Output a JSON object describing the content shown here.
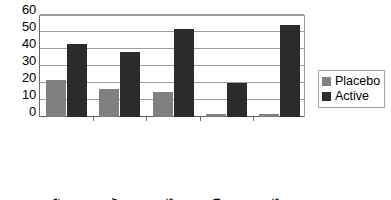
{
  "chart_data": {
    "type": "bar",
    "title": "",
    "subtitle": "",
    "xlabel": "",
    "ylabel": "",
    "categories": [
      "Overall Appearance",
      "Laxity",
      "Fine Lines",
      "Mottled Pigmentation",
      "Wrinkles"
    ],
    "category_lines": [
      [
        "Overall",
        "Appearance"
      ],
      [
        "Laxity"
      ],
      [
        "Fine Lines"
      ],
      [
        "Mottled",
        "Pigmentation"
      ],
      [
        "Wrinkles"
      ]
    ],
    "series": [
      {
        "name": "Placebo",
        "color": "#808080",
        "values": [
          22,
          16.5,
          14.5,
          2,
          2
        ]
      },
      {
        "name": "Active",
        "color": "#2b2b2b",
        "values": [
          43,
          38.5,
          52,
          20,
          54
        ]
      }
    ],
    "ylim": [
      0,
      60
    ],
    "yticks": [
      0,
      10,
      20,
      30,
      40,
      50,
      60
    ],
    "ytick_labels": [
      "0",
      "10",
      "20",
      "30",
      "40",
      "50",
      "60"
    ],
    "grid": true,
    "grid_axis": "y",
    "legend_position": "right",
    "orientation": "vertical",
    "label_rotation": 90
  },
  "legend": {
    "entries": [
      {
        "label": "Placebo",
        "swatch": "placebo-swatch"
      },
      {
        "label": "Active",
        "swatch": "active-swatch"
      }
    ]
  }
}
